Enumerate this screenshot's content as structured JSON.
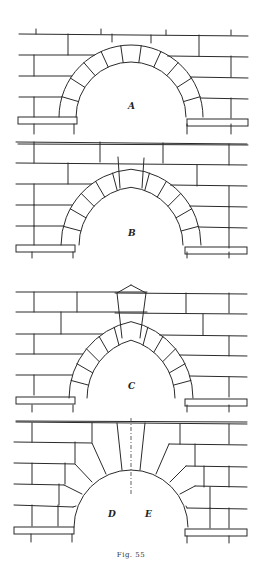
{
  "figure": {
    "caption": "Fig. 55",
    "panels": [
      {
        "id": "A",
        "label": "A",
        "arch_type": "semicircular",
        "voussoirs": 11
      },
      {
        "id": "B",
        "label": "B",
        "arch_type": "slightly pointed",
        "voussoirs": 12
      },
      {
        "id": "C",
        "label": "C",
        "arch_type": "pointed",
        "voussoirs": 12
      },
      {
        "id": "DE",
        "labels": [
          "D",
          "E"
        ],
        "arch_type": "semicircular with stepped extrados voussoirs",
        "voussoirs": 8
      }
    ]
  }
}
